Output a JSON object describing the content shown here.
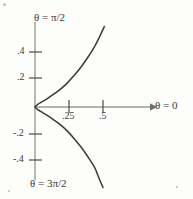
{
  "figure": {
    "background_color": "#fdfdfc",
    "axis_color": "#9a9a9a",
    "curve_color": "#3a3a3a",
    "text_color": "#3a3a3a"
  },
  "labels": {
    "theta_half_pi": "θ = π/2",
    "theta_three_half_pi": "θ = 3π/2",
    "theta_zero": "θ = 0"
  },
  "chart_data": {
    "type": "line",
    "title": "",
    "subtitle": "",
    "xlabel": "θ = 0",
    "ylabel": "",
    "grid": false,
    "legend": "none",
    "axis_style": "cross-axes-at-origin",
    "x_arrow": true,
    "xlim": [
      -0.03,
      0.72
    ],
    "ylim": [
      -0.58,
      0.58
    ],
    "x_ticks": [
      0.25,
      0.5
    ],
    "x_tick_labels": [
      ".25",
      ".5"
    ],
    "y_ticks": [
      0.4,
      0.2,
      -0.2,
      -0.4
    ],
    "y_tick_labels": [
      ".4",
      ".2",
      "-.2",
      "-.4"
    ],
    "annotations": [
      {
        "text": "θ = π/2",
        "position": "top-of-vertical-axis"
      },
      {
        "text": "θ = 3π/2",
        "position": "bottom-of-vertical-axis"
      },
      {
        "text": "θ = 0",
        "position": "right-of-horizontal-axis-arrow"
      }
    ],
    "series": [
      {
        "name": "upper-branch",
        "points": [
          [
            0.0,
            0.0
          ],
          [
            0.02,
            0.018
          ],
          [
            0.05,
            0.035
          ],
          [
            0.09,
            0.058
          ],
          [
            0.14,
            0.09
          ],
          [
            0.19,
            0.125
          ],
          [
            0.24,
            0.168
          ],
          [
            0.29,
            0.22
          ],
          [
            0.34,
            0.278
          ],
          [
            0.39,
            0.345
          ],
          [
            0.44,
            0.42
          ],
          [
            0.48,
            0.495
          ],
          [
            0.51,
            0.555
          ]
        ]
      },
      {
        "name": "lower-branch",
        "points": [
          [
            0.0,
            0.0
          ],
          [
            0.02,
            -0.018
          ],
          [
            0.05,
            -0.035
          ],
          [
            0.09,
            -0.058
          ],
          [
            0.14,
            -0.09
          ],
          [
            0.19,
            -0.125
          ],
          [
            0.24,
            -0.168
          ],
          [
            0.29,
            -0.22
          ],
          [
            0.34,
            -0.278
          ],
          [
            0.39,
            -0.345
          ],
          [
            0.44,
            -0.42
          ],
          [
            0.47,
            -0.49
          ],
          [
            0.5,
            -0.555
          ]
        ]
      }
    ]
  }
}
